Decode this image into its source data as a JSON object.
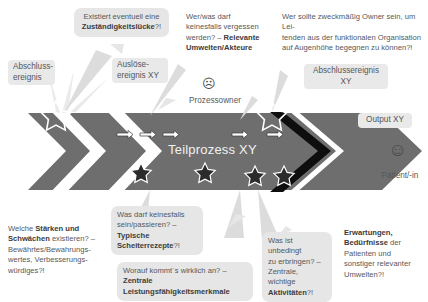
{
  "diagram": {
    "title_on_band": "Teilprozess XY",
    "band_color": "#6e6e6e",
    "bubble_color": "#e6e6e6",
    "accent_outline_color": "#111111",
    "text_color": "#55565a"
  },
  "band": {
    "process_label": "Teilprozess XY",
    "arrow_glyph": "⇒",
    "star_glyph": "★",
    "arrow_count": 5,
    "star_count": 4
  },
  "labels": {
    "start_event_left": "Abschluss-\nereignis",
    "trigger_event": "Auslöse-\nereignis XY",
    "process_owner": "Prozessowner",
    "process_owner_face": "☹",
    "end_event_right": "Abschlussereignis XY",
    "output": "Output XY",
    "patient": "Patient/-in",
    "patient_face": "☺"
  },
  "callouts": [
    {
      "id": "zustaendigkeitsluecke",
      "text_plain": "Existiert eventuell eine ",
      "text_bold": "Zuständigkeitslücke",
      "text_tail": "?!"
    },
    {
      "id": "relevante-umwelten",
      "line1": "Wer/was darf",
      "line2": "keinesfalls vergessen",
      "line3_plain": "werden? – ",
      "line3_bold": "Relevante",
      "line4_bold": "Umwelten/Akteure"
    },
    {
      "id": "owner-frage",
      "line1": "Wer sollte zweckmäßig Owner sein, um Lei-",
      "line2": "tenden aus der funktionalen Organisation",
      "line3": "auf Augenhöhe begegnen zu können?!"
    },
    {
      "id": "staerken-schwaechen",
      "l1_plain": "Welche ",
      "l1_bold": "Stärken und",
      "l2_bold": "Schwächen",
      "l2_plain": " existieren? –",
      "l3": "Bewährtes/Bewahrungs-",
      "l4": "wertes, Verbesserungs-",
      "l5": "würdiges?!"
    },
    {
      "id": "scheiterrezepte",
      "l1": "Was darf keinesfalls",
      "l2_plain": "sein/passieren? – ",
      "l2_bold": "Typische",
      "l3_bold": "Scheiterrezepte",
      "l3_tail": "?!"
    },
    {
      "id": "leistungsfaehigkeitsmerkmale",
      "l1_plain": "Worauf kommt´s wirklich an? – ",
      "l1_bold": "Zentrale",
      "l2_bold": "Leistungsfähigkeitsmerkmale"
    },
    {
      "id": "zentrale-aktivitaeten",
      "l1": "Was ist unbedingt",
      "l2_plain": "zu erbringen? –",
      "l3_plain": "Zentrale, wichtige",
      "l4_bold": "Aktivitäten",
      "l4_tail": "?!"
    },
    {
      "id": "erwartungen-beduerfnisse",
      "l1_bold": "Erwartungen,",
      "l2_bold": "Bedürfnisse",
      "l2_plain": " der",
      "l3": "Patienten und",
      "l4": "sonstiger relevanter",
      "l5": "Umwelten?!"
    }
  ]
}
